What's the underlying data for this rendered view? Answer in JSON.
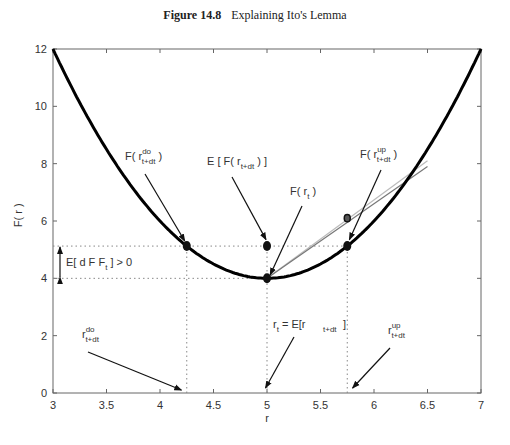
{
  "figure": {
    "number": "Figure 14.8",
    "caption": "Explaining Ito's Lemma"
  },
  "chart_data": {
    "type": "line",
    "xlabel": "r",
    "ylabel": "F( r )",
    "xlim": [
      3,
      7
    ],
    "ylim": [
      0,
      12
    ],
    "xticks": [
      3,
      3.5,
      4,
      4.5,
      5,
      5.5,
      6,
      6.5,
      7
    ],
    "xtick_labels": [
      "3",
      "3.5",
      "4",
      "4.5",
      "5",
      "5.5",
      "6",
      "6.5",
      "7"
    ],
    "yticks": [
      0,
      2,
      4,
      6,
      8,
      10,
      12
    ],
    "ytick_labels": [
      "0",
      "2",
      "4",
      "6",
      "8",
      "10",
      "12"
    ],
    "grid": false,
    "series": [
      {
        "name": "F(r) = 2(r-5)^2 + 4",
        "x": [
          3,
          3.5,
          4,
          4.25,
          4.5,
          5,
          5.5,
          5.75,
          6,
          6.5,
          7
        ],
        "values": [
          12,
          8.5,
          6,
          5.125,
          4.5,
          4,
          4.5,
          5.125,
          6,
          8.5,
          12
        ],
        "color": "#000000"
      },
      {
        "name": "chord-light",
        "x": [
          5,
          6.5
        ],
        "values": [
          4,
          8.1
        ],
        "color": "#bbbbbb"
      },
      {
        "name": "chord-dark",
        "x": [
          5,
          6.5
        ],
        "values": [
          4,
          7.9
        ],
        "color": "#777777"
      }
    ],
    "points": [
      {
        "label": "F(r_t)",
        "x": 5,
        "y": 4
      },
      {
        "label": "F(r^do_t+dt)",
        "x": 4.25,
        "y": 5.125
      },
      {
        "label": "F(r^up_t+dt)",
        "x": 5.75,
        "y": 5.125
      },
      {
        "label": "E[F(r_t+dt)]",
        "x": 5,
        "y": 5.125
      },
      {
        "label": "chord point",
        "x": 5.75,
        "y": 6.1
      }
    ],
    "reference_lines": {
      "horizontal_dotted": [
        4,
        5.125
      ],
      "vertical_dotted": [
        4.25,
        5,
        5.75
      ]
    },
    "annotations": [
      {
        "text": "F( r^do_t+dt )",
        "text_at": [
          4.1,
          7.1
        ],
        "arrow_to": [
          4.25,
          5.3
        ]
      },
      {
        "text": "E [ F( r_t+dt ) ]",
        "text_at": [
          4.9,
          7.0
        ],
        "arrow_to": [
          5.0,
          5.35
        ]
      },
      {
        "text": "F( r_t )",
        "text_at": [
          5.2,
          6.6
        ],
        "arrow_to": [
          5.02,
          4.1
        ]
      },
      {
        "text": "F( r^up_t+dt )",
        "text_at": [
          6.2,
          7.8
        ],
        "arrow_to": [
          5.77,
          5.35
        ]
      },
      {
        "text": "E[ d F_t ] > 0",
        "text_at": [
          3.2,
          4.6
        ],
        "double_arrow_y": [
          4,
          5.125
        ]
      },
      {
        "text": "r^do_t+dt",
        "text_at": [
          3.75,
          2.3
        ],
        "arrow_to": [
          4.2,
          0.05
        ]
      },
      {
        "text": "r_t = E[r_t+dt ]",
        "text_at": [
          5.0,
          2.3
        ],
        "arrow_to": [
          4.93,
          0.05
        ]
      },
      {
        "text": "r^up_t+dt",
        "text_at": [
          6.25,
          2.3
        ],
        "arrow_to": [
          5.8,
          0.05
        ]
      }
    ]
  },
  "labels": {
    "F": "F(",
    "r": "r",
    "close": ")",
    "E": "E [ F(",
    "Eclose": ") ]",
    "do": "do",
    "up": "up",
    "tdt": "t+dt",
    "t": "t",
    "edf": "E[ d F",
    "edf_tail": "] > 0",
    "rt_eq": "= E[r",
    "bracket": "]"
  }
}
